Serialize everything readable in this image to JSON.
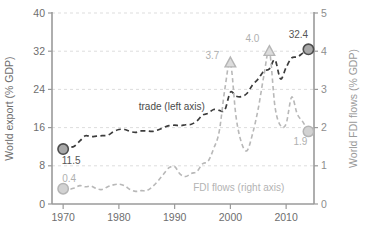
{
  "chart_data": {
    "type": "line",
    "title": "",
    "xlabel": "",
    "ylabel": "World export (% GDP)",
    "ylabel_right": "World FDI flows (% GDP)",
    "xlim": [
      1968,
      2015
    ],
    "ylim": [
      0,
      40
    ],
    "ylim_right": [
      0,
      5
    ],
    "grid": true,
    "legend_position": "inline-annotation",
    "xticks": [
      "1970",
      "1980",
      "1990",
      "2000",
      "2010"
    ],
    "xtick_values": [
      1970,
      1980,
      1990,
      2000,
      2010
    ],
    "yticks_left": [
      "0",
      "8",
      "16",
      "24",
      "32",
      "40"
    ],
    "ytick_values_left": [
      0,
      8,
      16,
      24,
      32,
      40
    ],
    "yticks_right": [
      "0",
      "1",
      "2",
      "3",
      "4",
      "5"
    ],
    "ytick_values_right": [
      0,
      1,
      2,
      3,
      4,
      5
    ],
    "series": [
      {
        "name": "trade (left axis)",
        "axis": "left",
        "color": "#3c3c3c",
        "style": "dashed",
        "label_text": "trade (left axis)",
        "x": [
          1970,
          1971,
          1972,
          1973,
          1974,
          1975,
          1976,
          1977,
          1978,
          1979,
          1980,
          1981,
          1982,
          1983,
          1984,
          1985,
          1986,
          1987,
          1988,
          1989,
          1990,
          1991,
          1992,
          1993,
          1994,
          1995,
          1996,
          1997,
          1998,
          1999,
          2000,
          2001,
          2002,
          2003,
          2004,
          2005,
          2006,
          2007,
          2008,
          2009,
          2010,
          2011,
          2012,
          2013,
          2014
        ],
        "y": [
          11.5,
          11.8,
          12.1,
          13.2,
          14.3,
          14.1,
          14.2,
          14.3,
          14.4,
          15.1,
          15.6,
          15.6,
          15.2,
          15.0,
          15.3,
          15.3,
          15.2,
          15.5,
          16.0,
          16.4,
          16.5,
          16.4,
          16.6,
          16.7,
          17.4,
          18.6,
          19.0,
          19.8,
          19.6,
          19.7,
          23.4,
          22.6,
          22.5,
          23.2,
          25.0,
          26.2,
          27.8,
          28.3,
          30.2,
          26.2,
          28.6,
          30.6,
          30.8,
          31.6,
          32.4
        ]
      },
      {
        "name": "FDI flows (right axis)",
        "axis": "right",
        "color": "#b8b8b8",
        "style": "dashed",
        "label_text": "FDI flows (right axis)",
        "x": [
          1970,
          1971,
          1972,
          1973,
          1974,
          1975,
          1976,
          1977,
          1978,
          1979,
          1980,
          1981,
          1982,
          1983,
          1984,
          1985,
          1986,
          1987,
          1988,
          1989,
          1990,
          1991,
          1992,
          1993,
          1994,
          1995,
          1996,
          1997,
          1998,
          1999,
          2000,
          2001,
          2002,
          2003,
          2004,
          2005,
          2006,
          2007,
          2008,
          2009,
          2010,
          2011,
          2012,
          2013,
          2014
        ],
        "y": [
          0.4,
          0.38,
          0.42,
          0.48,
          0.45,
          0.47,
          0.4,
          0.38,
          0.45,
          0.5,
          0.52,
          0.48,
          0.38,
          0.33,
          0.35,
          0.35,
          0.45,
          0.6,
          0.78,
          0.95,
          0.98,
          0.78,
          0.72,
          0.8,
          0.85,
          1.05,
          1.12,
          1.45,
          1.9,
          3.0,
          3.7,
          2.3,
          1.6,
          1.4,
          1.85,
          2.5,
          3.35,
          4.0,
          2.55,
          2.05,
          2.1,
          2.8,
          2.35,
          2.15,
          1.9
        ]
      }
    ],
    "annotations": [
      {
        "label": "11.5",
        "x": 1970,
        "y": 11.5,
        "axis": "left",
        "marker": "circle",
        "tone": "dark",
        "dx": 8,
        "dy": 15
      },
      {
        "label": "0.4",
        "x": 1970,
        "y": 0.4,
        "axis": "right",
        "marker": "circle",
        "tone": "light",
        "dx": 6,
        "dy": -7
      },
      {
        "label": "3.7",
        "x": 2000,
        "y": 3.7,
        "axis": "right",
        "marker": "triangle",
        "tone": "light",
        "dx": -18,
        "dy": -4
      },
      {
        "label": "4.0",
        "x": 2007,
        "y": 4.0,
        "axis": "right",
        "marker": "triangle",
        "tone": "light",
        "dx": -17,
        "dy": -9
      },
      {
        "label": "32.4",
        "x": 2014,
        "y": 32.4,
        "axis": "left",
        "marker": "circle",
        "tone": "dark",
        "dx": -10,
        "dy": -11
      },
      {
        "label": "1.9",
        "x": 2014,
        "y": 1.9,
        "axis": "right",
        "marker": "circle",
        "tone": "light",
        "dx": -8,
        "dy": 14
      }
    ],
    "series_label_positions": [
      {
        "which": "trade",
        "x": 1989.5,
        "y": 20.5,
        "anchor": "middle"
      },
      {
        "which": "fdi",
        "x": 2001.5,
        "y": 0.42,
        "anchor": "middle"
      }
    ]
  }
}
